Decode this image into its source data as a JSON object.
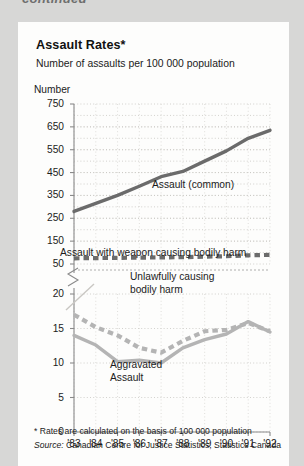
{
  "page": {
    "continued_label": "continued",
    "background_color": "#d7d7d6",
    "card_color": "#fdfdfc"
  },
  "chart_data": {
    "type": "line",
    "title": "Assault Rates*",
    "subtitle": "Number of assaults per 100 000 population",
    "ylabel": "Number",
    "xlabel": "",
    "grid": true,
    "legend_position": "inline-annotations",
    "broken_axis": true,
    "categories": [
      "'83",
      "'84",
      "'85",
      "'86",
      "'87",
      "'88",
      "'89",
      "'90",
      "'91",
      "'92"
    ],
    "panels": [
      {
        "name": "upper",
        "ylim": [
          50,
          750
        ],
        "yticks": [
          50,
          150,
          250,
          350,
          450,
          550,
          650,
          750
        ],
        "series": [
          {
            "name": "Assault (common)",
            "style": "solid",
            "color": "#6b6b6b",
            "values": [
              280,
              315,
              350,
              390,
              432,
              455,
              500,
              545,
              600,
              635
            ]
          },
          {
            "name": "Assault with weapon causing bodily harm",
            "style": "dashed",
            "color": "#6b6b6b",
            "values": [
              75,
              76,
              77,
              78,
              79,
              80,
              82,
              84,
              88,
              90
            ]
          }
        ]
      },
      {
        "name": "lower",
        "ylim": [
          0,
          20
        ],
        "yticks": [
          0,
          5,
          10,
          15,
          20
        ],
        "series": [
          {
            "name": "Unlawfully causing bodily harm",
            "style": "dashed",
            "color": "#b4b4b4",
            "values": [
              17.0,
              15.2,
              14.0,
              12.2,
              11.5,
              13.2,
              14.6,
              14.8,
              15.8,
              14.6
            ]
          },
          {
            "name": "Aggravated Assault",
            "style": "solid",
            "color": "#b4b4b4",
            "values": [
              14.0,
              12.6,
              10.2,
              10.4,
              10.0,
              12.2,
              13.4,
              14.2,
              16.0,
              14.5
            ]
          }
        ]
      }
    ],
    "annotations": [
      {
        "text": "Assault (common)",
        "x": 152,
        "y": 178
      },
      {
        "text": "Assault with weapon causing bodily harm",
        "x": 60,
        "y": 246
      },
      {
        "text": "Unlawfully causing",
        "x": 130,
        "y": 270
      },
      {
        "text": "bodily harm",
        "x": 130,
        "y": 283
      },
      {
        "text": "Aggravated",
        "x": 110,
        "y": 358
      },
      {
        "text": "Assault",
        "x": 110,
        "y": 371
      }
    ],
    "footnote": "* Rates are calculated on the basis of 100 000 population",
    "source_label": "Source:",
    "source_text": "Canadian Centre for Justice Statistics, Statistics Canada"
  }
}
